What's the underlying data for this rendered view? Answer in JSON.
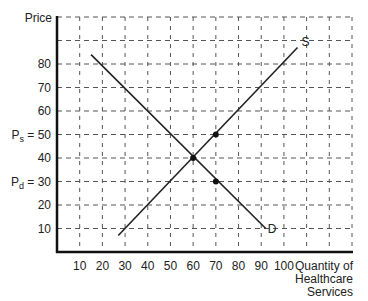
{
  "chart_data": {
    "type": "line",
    "title": "",
    "xlabel": "Quantity of Healthcare Services",
    "xlabel_lines": [
      "Quantity of",
      "Healthcare",
      "Services"
    ],
    "ylabel": "Price",
    "xlim": [
      0,
      130
    ],
    "ylim": [
      0,
      100
    ],
    "grid": true,
    "grid_style": "dashed",
    "x_ticks": [
      10,
      20,
      30,
      40,
      50,
      60,
      70,
      80,
      90,
      100
    ],
    "y_ticks": [
      {
        "value": 80,
        "label": "80"
      },
      {
        "value": 70,
        "label": "70"
      },
      {
        "value": 60,
        "label": "60"
      },
      {
        "value": 50,
        "label": "P_s = 50",
        "prefix": "P",
        "sub": "s",
        "num": "= 50"
      },
      {
        "value": 40,
        "label": "40"
      },
      {
        "value": 30,
        "label": "P_d = 30",
        "prefix": "P",
        "sub": "d",
        "num": "= 30"
      },
      {
        "value": 20,
        "label": "20"
      },
      {
        "value": 10,
        "label": "10"
      }
    ],
    "series": [
      {
        "name": "S",
        "label": "S",
        "points": [
          [
            27,
            7
          ],
          [
            106,
            87
          ]
        ]
      },
      {
        "name": "D",
        "label": "D",
        "points": [
          [
            15,
            84
          ],
          [
            92,
            10
          ]
        ]
      }
    ],
    "points": [
      {
        "name": "equilibrium",
        "x": 60,
        "y": 40
      },
      {
        "name": "supply-price-point",
        "x": 70,
        "y": 50
      },
      {
        "name": "demand-price-point",
        "x": 70,
        "y": 30
      }
    ]
  }
}
